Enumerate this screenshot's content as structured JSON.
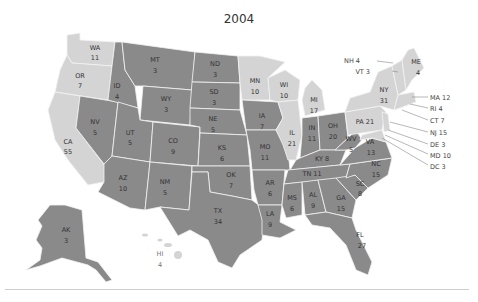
{
  "title": "2004",
  "legend_colors": {
    "dark": "#8a8a8a",
    "light": "#d4d4d4"
  },
  "states": [
    {
      "abbr": "WA",
      "votes": "11",
      "shade": "light"
    },
    {
      "abbr": "OR",
      "votes": "7",
      "shade": "light"
    },
    {
      "abbr": "CA",
      "votes": "55",
      "shade": "light"
    },
    {
      "abbr": "NV",
      "votes": "5",
      "shade": "dark"
    },
    {
      "abbr": "ID",
      "votes": "4",
      "shade": "dark"
    },
    {
      "abbr": "MT",
      "votes": "3",
      "shade": "dark"
    },
    {
      "abbr": "WY",
      "votes": "3",
      "shade": "dark"
    },
    {
      "abbr": "UT",
      "votes": "5",
      "shade": "dark"
    },
    {
      "abbr": "AZ",
      "votes": "10",
      "shade": "dark"
    },
    {
      "abbr": "CO",
      "votes": "9",
      "shade": "dark"
    },
    {
      "abbr": "NM",
      "votes": "5",
      "shade": "dark"
    },
    {
      "abbr": "ND",
      "votes": "3",
      "shade": "dark"
    },
    {
      "abbr": "SD",
      "votes": "3",
      "shade": "dark"
    },
    {
      "abbr": "NE",
      "votes": "5",
      "shade": "dark"
    },
    {
      "abbr": "KS",
      "votes": "6",
      "shade": "dark"
    },
    {
      "abbr": "OK",
      "votes": "7",
      "shade": "dark"
    },
    {
      "abbr": "TX",
      "votes": "34",
      "shade": "dark"
    },
    {
      "abbr": "MN",
      "votes": "10",
      "shade": "light"
    },
    {
      "abbr": "IA",
      "votes": "7",
      "shade": "dark"
    },
    {
      "abbr": "MO",
      "votes": "11",
      "shade": "dark"
    },
    {
      "abbr": "AR",
      "votes": "6",
      "shade": "dark"
    },
    {
      "abbr": "LA",
      "votes": "9",
      "shade": "dark"
    },
    {
      "abbr": "WI",
      "votes": "10",
      "shade": "light"
    },
    {
      "abbr": "IL",
      "votes": "21",
      "shade": "light"
    },
    {
      "abbr": "MI",
      "votes": "17",
      "shade": "light"
    },
    {
      "abbr": "IN",
      "votes": "11",
      "shade": "dark"
    },
    {
      "abbr": "OH",
      "votes": "20",
      "shade": "dark"
    },
    {
      "abbr": "KY",
      "votes": "8",
      "shade": "dark"
    },
    {
      "abbr": "TN",
      "votes": "11",
      "shade": "dark"
    },
    {
      "abbr": "MS",
      "votes": "6",
      "shade": "dark"
    },
    {
      "abbr": "AL",
      "votes": "9",
      "shade": "dark"
    },
    {
      "abbr": "GA",
      "votes": "15",
      "shade": "dark"
    },
    {
      "abbr": "FL",
      "votes": "27",
      "shade": "dark"
    },
    {
      "abbr": "SC",
      "votes": "8",
      "shade": "dark"
    },
    {
      "abbr": "NC",
      "votes": "15",
      "shade": "dark"
    },
    {
      "abbr": "VA",
      "votes": "13",
      "shade": "dark"
    },
    {
      "abbr": "WV",
      "votes": "5",
      "shade": "dark"
    },
    {
      "abbr": "PA",
      "votes": "21",
      "shade": "light"
    },
    {
      "abbr": "NY",
      "votes": "31",
      "shade": "light"
    },
    {
      "abbr": "ME",
      "votes": "4",
      "shade": "light"
    },
    {
      "abbr": "AK",
      "votes": "3",
      "shade": "dark"
    },
    {
      "abbr": "HI",
      "votes": "4",
      "shade": "light"
    }
  ],
  "labels": {
    "WA": "WA",
    "WA_v": "11",
    "OR": "OR",
    "OR_v": "7",
    "CA": "CA",
    "CA_v": "55",
    "NV": "NV",
    "NV_v": "5",
    "ID": "ID",
    "ID_v": "4",
    "MT": "MT",
    "MT_v": "3",
    "WY": "WY",
    "WY_v": "3",
    "UT": "UT",
    "UT_v": "5",
    "AZ": "AZ",
    "AZ_v": "10",
    "CO": "CO",
    "CO_v": "9",
    "NM": "NM",
    "NM_v": "5",
    "ND": "ND",
    "ND_v": "3",
    "SD": "SD",
    "SD_v": "3",
    "NE": "NE",
    "NE_v": "5",
    "KS": "KS",
    "KS_v": "6",
    "OK": "OK",
    "OK_v": "7",
    "TX": "TX",
    "TX_v": "34",
    "MN": "MN",
    "MN_v": "10",
    "IA": "IA",
    "IA_v": "7",
    "MO": "MO",
    "MO_v": "11",
    "AR": "AR",
    "AR_v": "6",
    "LA": "LA",
    "LA_v": "9",
    "WI": "WI",
    "WI_v": "10",
    "IL": "IL",
    "IL_v": "21",
    "MI": "MI",
    "MI_v": "17",
    "IN": "IN",
    "IN_v": "11",
    "OH": "OH",
    "OH_v": "20",
    "KY": "KY 8",
    "TN": "TN 11",
    "MS": "MS",
    "MS_v": "6",
    "AL": "AL",
    "AL_v": "9",
    "GA": "GA",
    "GA_v": "15",
    "FL": "FL",
    "FL_v": "27",
    "SC": "SC",
    "SC_v": "8",
    "NC": "NC",
    "NC_v": "15",
    "VA": "VA",
    "VA_v": "13",
    "WV": "WV",
    "WV_v": "5",
    "PA": "PA 21",
    "NY": "NY",
    "NY_v": "31",
    "ME": "ME",
    "ME_v": "4",
    "AK": "AK",
    "AK_v": "3",
    "HI": "HI",
    "HI_v": "4"
  },
  "callouts": {
    "NH": "NH 4",
    "VT": "VT 3",
    "MA": "MA 12",
    "RI": "RI 4",
    "CT": "CT 7",
    "NJ": "NJ 15",
    "DE": "DE 3",
    "MD": "MD 10",
    "DC": "DC 3"
  }
}
